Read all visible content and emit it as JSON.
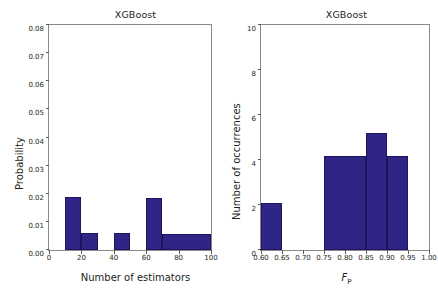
{
  "figure": {
    "background": "#ffffff",
    "bar_color": "#2e2585",
    "axis_color": "#8a8a8a",
    "text_color": "#231f20"
  },
  "panels": [
    {
      "key": "left",
      "title": "XGBoost",
      "xlabel": "Number of estimators",
      "ylabel": "Probability",
      "ytick_labels": [
        "0.00",
        "0.01",
        "0.02",
        "0.03",
        "0.04",
        "0.05",
        "0.06",
        "0.07",
        "0.08"
      ],
      "xtick_labels": [
        "0",
        "20",
        "40",
        "60",
        "80",
        "100"
      ]
    },
    {
      "key": "right",
      "title": "XGBoost",
      "xlabel_main": "F",
      "xlabel_sub": "P",
      "ylabel": "Number of occurrences",
      "ytick_labels": [
        "0",
        "2",
        "4",
        "6",
        "8",
        "10"
      ],
      "xtick_labels": [
        "0.60",
        "0.65",
        "0.70",
        "0.75",
        "0.80",
        "0.85",
        "0.90",
        "0.95",
        "1.00"
      ]
    }
  ],
  "chart_data": [
    {
      "type": "bar",
      "id": "left-histogram",
      "title": "XGBoost",
      "xlabel": "Number of estimators",
      "ylabel": "Probability",
      "xlim": [
        0,
        100
      ],
      "ylim": [
        0.0,
        0.08
      ],
      "xticks": [
        0,
        20,
        40,
        60,
        80,
        100
      ],
      "yticks": [
        0.0,
        0.01,
        0.02,
        0.03,
        0.04,
        0.05,
        0.06,
        0.07,
        0.08
      ],
      "grid": false,
      "legend": null,
      "bins": [
        {
          "x0": 10,
          "x1": 20,
          "value": 0.0187
        },
        {
          "x0": 20,
          "x1": 30,
          "value": 0.006
        },
        {
          "x0": 40,
          "x1": 50,
          "value": 0.006
        },
        {
          "x0": 60,
          "x1": 70,
          "value": 0.0185
        },
        {
          "x0": 70,
          "x1": 100,
          "value": 0.0057
        }
      ]
    },
    {
      "type": "bar",
      "id": "right-histogram",
      "title": "XGBoost",
      "xlabel": "F_P",
      "ylabel": "Number of occurrences",
      "xlim": [
        0.6,
        1.0
      ],
      "ylim": [
        0,
        10
      ],
      "xticks": [
        0.6,
        0.65,
        0.7,
        0.75,
        0.8,
        0.85,
        0.9,
        0.95,
        1.0
      ],
      "yticks": [
        0,
        2,
        4,
        6,
        8,
        10
      ],
      "grid": false,
      "legend": null,
      "bins": [
        {
          "x0": 0.6,
          "x1": 0.65,
          "value": 2.1
        },
        {
          "x0": 0.75,
          "x1": 0.85,
          "value": 4.2
        },
        {
          "x0": 0.85,
          "x1": 0.9,
          "value": 5.2
        },
        {
          "x0": 0.9,
          "x1": 0.95,
          "value": 4.2
        }
      ]
    }
  ]
}
